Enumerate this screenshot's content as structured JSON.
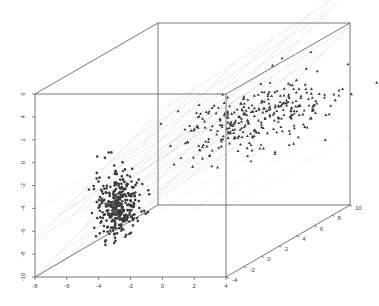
{
  "chart_data": {
    "type": "scatter",
    "title": "",
    "subtitle": "",
    "xlabel": "",
    "ylabel": "",
    "zlabel": "",
    "projection": "3d-oblique",
    "box": true,
    "grid": "regression planes (dotted)",
    "axes": {
      "x": {
        "range": [
          -8,
          4
        ],
        "ticks": [
          "-8",
          "-6",
          "-4",
          "-2",
          "0",
          "2",
          "4"
        ]
      },
      "y": {
        "range": [
          -4,
          10
        ],
        "ticks": [
          "-4",
          "-2",
          "0",
          "2",
          "4",
          "6",
          "8",
          "10"
        ]
      },
      "z": {
        "range": [
          -10,
          6
        ],
        "ticks": [
          "-10",
          "-8",
          "-6",
          "-4",
          "-2",
          "0",
          "2",
          "4",
          "6"
        ]
      }
    },
    "series": [
      {
        "name": "group 1",
        "marker": "circle",
        "color": "#333333",
        "n_approx": 300,
        "center": {
          "x": -3,
          "y": -1,
          "z": -4
        }
      },
      {
        "name": "group 2",
        "marker": "triangle",
        "color": "#333333",
        "n_approx": 300,
        "center": {
          "x": 1,
          "y": 7,
          "z": 2
        }
      }
    ]
  }
}
